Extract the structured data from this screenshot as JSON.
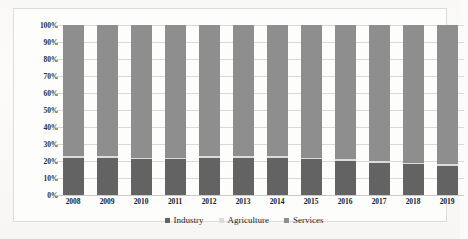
{
  "chart_data": {
    "type": "bar",
    "stacked": true,
    "normalized": "100%",
    "title": "",
    "xlabel": "",
    "ylabel": "",
    "ylim": [
      0,
      100
    ],
    "ytick_labels": [
      "100%",
      "90%",
      "80%",
      "70%",
      "60%",
      "50%",
      "40%",
      "30%",
      "20%",
      "10%",
      "0%"
    ],
    "ytick_values": [
      100,
      90,
      80,
      70,
      60,
      50,
      40,
      30,
      20,
      10,
      0
    ],
    "grid": true,
    "legend_position": "bottom-center",
    "categories": [
      "2008",
      "2009",
      "2010",
      "2011",
      "2012",
      "2013",
      "2014",
      "2015",
      "2016",
      "2017",
      "2018",
      "2019"
    ],
    "series": [
      {
        "name": "Industry",
        "color": "#636363",
        "values": [
          22,
          22,
          21,
          21,
          22,
          22,
          22,
          21,
          20,
          19,
          18,
          17
        ]
      },
      {
        "name": "Agriculture",
        "color": "#dcdcdc",
        "values": [
          1,
          1,
          1,
          1,
          1,
          1,
          1,
          1,
          1,
          1,
          1,
          1
        ]
      },
      {
        "name": "Services",
        "color": "#8e8e8e",
        "values": [
          77,
          77,
          78,
          78,
          77,
          77,
          77,
          78,
          79,
          80,
          81,
          82
        ]
      }
    ]
  },
  "legend": {
    "items": [
      {
        "label": "Industry",
        "color": "#636363"
      },
      {
        "label": "Agriculture",
        "color": "#dcdcdc"
      },
      {
        "label": "Services",
        "color": "#8e8e8e"
      }
    ]
  }
}
